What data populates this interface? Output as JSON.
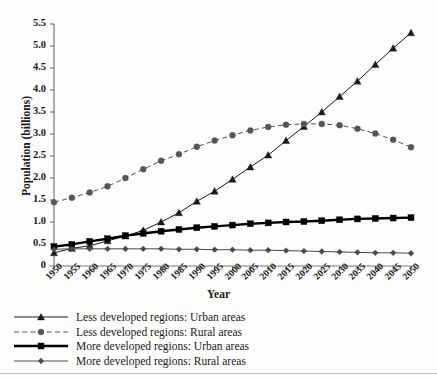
{
  "chart_data": {
    "type": "line",
    "title": "",
    "xlabel": "Year",
    "ylabel": "Population (billions)",
    "xlim": [
      1950,
      2050
    ],
    "ylim": [
      0,
      5.5
    ],
    "ytick_step": 0.5,
    "grid": false,
    "legend_position": "below-left",
    "x": [
      1950,
      1955,
      1960,
      1965,
      1970,
      1975,
      1980,
      1985,
      1990,
      1995,
      2000,
      2005,
      2010,
      2015,
      2020,
      2025,
      2030,
      2035,
      2040,
      2045,
      2050
    ],
    "categories": [
      "1950",
      "1955",
      "1960",
      "1965",
      "1970",
      "1975",
      "1980",
      "1985",
      "1990",
      "1995",
      "2000",
      "2005",
      "2010",
      "2015",
      "2020",
      "2025",
      "2030",
      "2035",
      "2040",
      "2045",
      "2050"
    ],
    "ytick_labels": [
      "0",
      "0.5",
      "1.0",
      "1.5",
      "2.0",
      "2.5",
      "3.0",
      "3.5",
      "4.0",
      "4.5",
      "5.0",
      "5.5"
    ],
    "ytick_values": [
      0,
      0.5,
      1.0,
      1.5,
      2.0,
      2.5,
      3.0,
      3.5,
      4.0,
      4.5,
      5.0,
      5.5
    ],
    "series": [
      {
        "name": "Less developed regions: Urban areas",
        "marker": "triangle",
        "line": "solid",
        "color": "#1a1a1a",
        "width": 1,
        "values": [
          0.3,
          0.4,
          0.46,
          0.57,
          0.68,
          0.81,
          1.0,
          1.21,
          1.47,
          1.7,
          1.97,
          2.25,
          2.52,
          2.85,
          3.17,
          3.5,
          3.85,
          4.2,
          4.58,
          4.95,
          5.3
        ]
      },
      {
        "name": "Less developed regions: Rural areas",
        "marker": "circle",
        "line": "dashed",
        "color": "#555555",
        "width": 1,
        "values": [
          1.45,
          1.55,
          1.67,
          1.81,
          2.0,
          2.2,
          2.39,
          2.54,
          2.71,
          2.85,
          2.97,
          3.08,
          3.16,
          3.21,
          3.23,
          3.23,
          3.2,
          3.12,
          3.01,
          2.87,
          2.7
        ]
      },
      {
        "name": "More developed regions: Urban areas",
        "marker": "square",
        "line": "solid",
        "color": "#000000",
        "width": 2.4,
        "values": [
          0.44,
          0.49,
          0.56,
          0.62,
          0.69,
          0.74,
          0.79,
          0.83,
          0.87,
          0.9,
          0.93,
          0.96,
          0.98,
          1.0,
          1.01,
          1.03,
          1.05,
          1.07,
          1.08,
          1.09,
          1.1
        ]
      },
      {
        "name": "More developed regions: Rural areas",
        "marker": "diamond",
        "line": "solid",
        "color": "#4a4a4a",
        "width": 1,
        "values": [
          0.38,
          0.39,
          0.39,
          0.39,
          0.39,
          0.39,
          0.39,
          0.38,
          0.38,
          0.37,
          0.37,
          0.36,
          0.36,
          0.35,
          0.34,
          0.33,
          0.32,
          0.31,
          0.3,
          0.3,
          0.29
        ]
      }
    ]
  },
  "legend": {
    "items": [
      {
        "label": "Less developed regions: Urban areas",
        "marker": "triangle",
        "line": "solid",
        "color": "#1a1a1a",
        "width": 1
      },
      {
        "label": "Less developed regions: Rural areas",
        "marker": "circle",
        "line": "dashed",
        "color": "#555555",
        "width": 1
      },
      {
        "label": "More developed regions: Urban areas",
        "marker": "square",
        "line": "solid",
        "color": "#000000",
        "width": 2.4
      },
      {
        "label": "More developed regions: Rural areas",
        "marker": "diamond",
        "line": "solid",
        "color": "#4a4a4a",
        "width": 1
      }
    ]
  },
  "axis": {
    "color": "#7a7a7a"
  }
}
